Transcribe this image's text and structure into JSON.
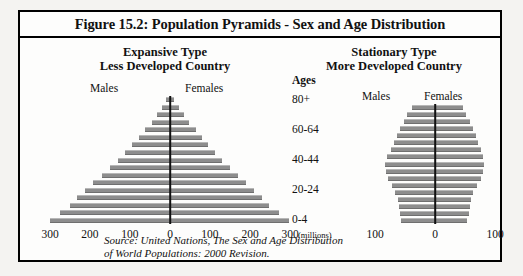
{
  "figure": {
    "title": "Figure 15.2: Population Pyramids - Sex and Age Distribution",
    "source_line1": "Source:  United Nations, The Sex and Age Distribution",
    "source_line2": "of World Populations: 2000 Revision.",
    "units_note": "(millions)",
    "bar_color": "#8d8d8d",
    "axis_color": "#111111",
    "frame_color": "#000000",
    "background": "#fdfdfc"
  },
  "left_panel": {
    "heading_line1": "Expansive Type",
    "heading_line2": "Less Developed Country",
    "males_label": "Males",
    "females_label": "Females"
  },
  "right_panel": {
    "heading_line1": "Stationary Type",
    "heading_line2": "More Developed Country",
    "males_label": "Males",
    "females_label": "Females"
  },
  "ages_axis": {
    "header": "Ages",
    "labels": [
      "80+",
      "60-64",
      "40-44",
      "20-24",
      "0-4"
    ]
  },
  "chart_data": [
    {
      "type": "bar",
      "title": "Expansive Type - Less Developed Country",
      "orientation": "horizontal-diverging",
      "xlabel": "(millions)",
      "ylabel": "Ages",
      "xlim": [
        -300,
        300
      ],
      "xticks": [
        300,
        200,
        100,
        0,
        100,
        200,
        300
      ],
      "grid": false,
      "legend": [
        "Males",
        "Females"
      ],
      "legend_position": "top",
      "categories": [
        "0-4",
        "5-9",
        "10-14",
        "15-19",
        "20-24",
        "25-29",
        "30-34",
        "35-39",
        "40-44",
        "45-49",
        "50-54",
        "55-59",
        "60-64",
        "65-69",
        "70-74",
        "75-79",
        "80+"
      ],
      "series": [
        {
          "name": "Males",
          "values": [
            300,
            275,
            250,
            232,
            213,
            193,
            170,
            150,
            130,
            112,
            95,
            78,
            62,
            46,
            32,
            20,
            9
          ]
        },
        {
          "name": "Females",
          "values": [
            298,
            272,
            248,
            230,
            211,
            191,
            169,
            149,
            129,
            112,
            96,
            80,
            64,
            48,
            34,
            22,
            11
          ]
        }
      ]
    },
    {
      "type": "bar",
      "title": "Stationary Type - More Developed Country",
      "orientation": "horizontal-diverging",
      "xlabel": "(millions)",
      "ylabel": "Ages",
      "xlim": [
        -100,
        100
      ],
      "xticks": [
        100,
        0,
        100
      ],
      "grid": false,
      "legend": [
        "Males",
        "Females"
      ],
      "legend_position": "top",
      "categories": [
        "0-4",
        "5-9",
        "10-14",
        "15-19",
        "20-24",
        "25-29",
        "30-34",
        "35-39",
        "40-44",
        "45-49",
        "50-54",
        "55-59",
        "60-64",
        "65-69",
        "70-74",
        "75-79",
        "80+"
      ],
      "series": [
        {
          "name": "Males",
          "values": [
            56,
            58,
            60,
            62,
            66,
            72,
            78,
            82,
            84,
            80,
            74,
            68,
            64,
            58,
            52,
            46,
            38
          ]
        },
        {
          "name": "Females",
          "values": [
            54,
            56,
            58,
            60,
            64,
            70,
            76,
            80,
            82,
            80,
            76,
            72,
            68,
            64,
            58,
            52,
            46
          ]
        }
      ]
    }
  ]
}
